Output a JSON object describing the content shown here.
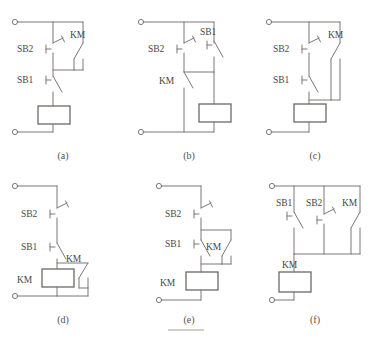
{
  "figure": {
    "type": "electrical-schematic-set",
    "background_color": "#ffffff",
    "line_color": "#7c7775",
    "coil_border_color": "#6e6866",
    "text_color": "#4a4644",
    "panel_count": 6,
    "grid": {
      "columns": 3,
      "rows": 2
    }
  },
  "symbols": {
    "sb1": "SB1",
    "sb2": "SB2",
    "km": "KM",
    "nc_contact": "normally-closed-pushbutton",
    "no_contact": "normally-open-pushbutton",
    "coil": "relay-coil-rectangle",
    "terminal": "terminal-dot"
  },
  "panels": [
    {
      "id": "a",
      "caption": "(a)",
      "labels": {
        "top_switch": "SB2",
        "bottom_switch": "SB1",
        "contact": "KM",
        "coil": ""
      },
      "description": "SB2 normally-closed in series with SB1 normally-open; KM holding contact bridges SB2 only; coil at bottom of main rail."
    },
    {
      "id": "b",
      "caption": "(b)",
      "labels": {
        "top_left_switch": "SB2",
        "top_right_switch": "SB1",
        "contact": "KM",
        "coil": ""
      },
      "description": "SB2 normally-closed and SB1 normally-open in parallel across the top; KM normally-open contact in the left branch; coil in the right branch."
    },
    {
      "id": "c",
      "caption": "(c)",
      "labels": {
        "top_switch": "SB2",
        "bottom_switch": "SB1",
        "contact": "KM",
        "coil": ""
      },
      "description": "SB2 normally-closed in series with SB1 normally-open; KM holding contact bridges both switches; coil at bottom."
    },
    {
      "id": "d",
      "caption": "(d)",
      "labels": {
        "top_switch": "SB2",
        "bottom_switch": "SB1",
        "contact": "KM",
        "coil": "KM"
      },
      "description": "SB2 normally-closed in series with SB1 normally-open; KM normally-open contact wired in parallel with the KM coil."
    },
    {
      "id": "e",
      "caption": "(e)",
      "labels": {
        "top_switch": "SB2",
        "bottom_switch": "SB1",
        "contact": "KM",
        "coil": "KM"
      },
      "description": "SB2 normally-closed in series with SB1 normally-open; KM holding contact bridges SB1 only; KM coil at the bottom."
    },
    {
      "id": "f",
      "caption": "(f)",
      "labels": {
        "branch1_switch": "SB1",
        "branch2_switch": "SB2",
        "branch3_contact": "KM",
        "coil": "KM"
      },
      "description": "SB1 normally-open, SB2 normally-closed and KM normally-open contact all connected in parallel; KM coil below the parallel group."
    }
  ]
}
